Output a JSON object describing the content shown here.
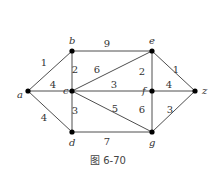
{
  "figure": {
    "caption": "图 6-70"
  },
  "graph": {
    "nodes": [
      {
        "id": "a",
        "label": "a",
        "x": 28,
        "y": 91,
        "lx": 17,
        "ly": 98
      },
      {
        "id": "b",
        "label": "b",
        "x": 72,
        "y": 51,
        "lx": 69,
        "ly": 44
      },
      {
        "id": "c",
        "label": "c",
        "x": 72,
        "y": 91,
        "lx": 63,
        "ly": 94
      },
      {
        "id": "d",
        "label": "d",
        "x": 72,
        "y": 132,
        "lx": 69,
        "ly": 146
      },
      {
        "id": "e",
        "label": "e",
        "x": 152,
        "y": 51,
        "lx": 149,
        "ly": 44
      },
      {
        "id": "f",
        "label": "f",
        "x": 152,
        "y": 91,
        "lx": 142,
        "ly": 94
      },
      {
        "id": "g",
        "label": "g",
        "x": 152,
        "y": 132,
        "lx": 149,
        "ly": 146
      },
      {
        "id": "z",
        "label": "z",
        "x": 195,
        "y": 91,
        "lx": 202,
        "ly": 94
      }
    ],
    "edges": [
      {
        "from": "a",
        "to": "b",
        "weight": "1",
        "wx": 44,
        "wy": 66
      },
      {
        "from": "a",
        "to": "c",
        "weight": "4",
        "wx": 53,
        "wy": 88
      },
      {
        "from": "a",
        "to": "d",
        "weight": "4",
        "wx": 44,
        "wy": 121
      },
      {
        "from": "b",
        "to": "e",
        "weight": "9",
        "wx": 107,
        "wy": 47
      },
      {
        "from": "b",
        "to": "c",
        "weight": "2",
        "wx": 75,
        "wy": 73
      },
      {
        "from": "c",
        "to": "e",
        "weight": "6",
        "wx": 97,
        "wy": 73
      },
      {
        "from": "c",
        "to": "f",
        "weight": "3",
        "wx": 114,
        "wy": 88
      },
      {
        "from": "c",
        "to": "g",
        "weight": "5",
        "wx": 115,
        "wy": 112
      },
      {
        "from": "c",
        "to": "d",
        "weight": "3",
        "wx": 75,
        "wy": 114
      },
      {
        "from": "e",
        "to": "f",
        "weight": "2",
        "wx": 142,
        "wy": 75
      },
      {
        "from": "e",
        "to": "z",
        "weight": "1",
        "wx": 176,
        "wy": 73
      },
      {
        "from": "f",
        "to": "z",
        "weight": "4",
        "wx": 169,
        "wy": 88
      },
      {
        "from": "f",
        "to": "g",
        "weight": "6",
        "wx": 142,
        "wy": 113
      },
      {
        "from": "g",
        "to": "z",
        "weight": "3",
        "wx": 170,
        "wy": 113
      },
      {
        "from": "d",
        "to": "g",
        "weight": "7",
        "wx": 107,
        "wy": 145
      }
    ]
  }
}
